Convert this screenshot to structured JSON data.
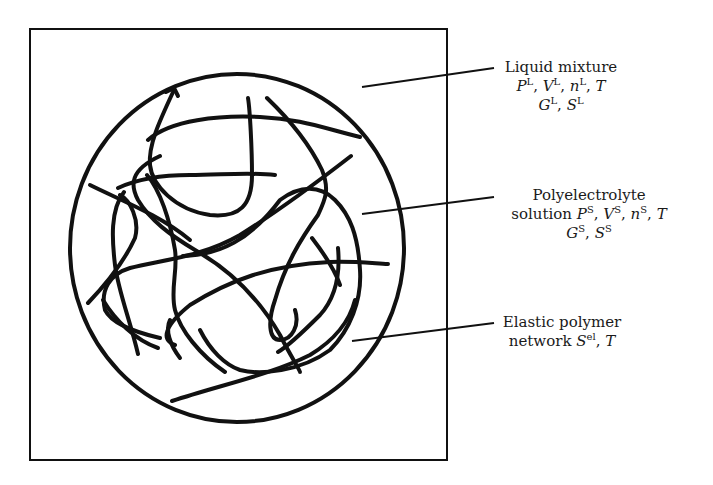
{
  "diagram": {
    "colors": {
      "stroke": "#111111",
      "background": "#ffffff",
      "text": "#1a1a1a"
    },
    "labels": {
      "liquid": {
        "line1": "Liquid mixture",
        "P": "P",
        "P_sup": "L",
        "V": "V",
        "V_sup": "L",
        "n": "n",
        "n_sup": "L",
        "T": "T",
        "G": "G",
        "G_sup": "L",
        "S": "S",
        "S_sup": "L"
      },
      "solution": {
        "line1": "Polyelectrolyte",
        "line2_prefix": "solution ",
        "P": "P",
        "P_sup": "S",
        "V": "V",
        "V_sup": "S",
        "n": "n",
        "n_sup": "S",
        "T": "T",
        "G": "G",
        "G_sup": "S",
        "S": "S",
        "S_sup": "S"
      },
      "network": {
        "line1": "Elastic polymer",
        "line2_prefix": "network ",
        "S": "S",
        "S_sup": "el",
        "T": "T"
      }
    },
    "separators": {
      "comma": ", "
    }
  }
}
